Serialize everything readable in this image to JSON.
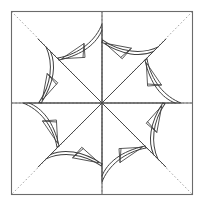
{
  "figure": {
    "title": "Eight-pointed curved star quilt block line drawing",
    "kind": "line-drawing",
    "canvas": {
      "width": 203,
      "height": 205,
      "background": "#ffffff"
    },
    "frame": {
      "name": "outer-square-border",
      "x": 11.5,
      "y": 11.5,
      "width": 181,
      "height": 183,
      "stroke": "#6b6b6b",
      "stroke_width": 1.1,
      "fill": "none"
    },
    "center": {
      "x": 102,
      "y": 103
    },
    "guides": {
      "stroke": "#9a9a9a",
      "stroke_width": 0.9,
      "dash": "1.6 2.2",
      "horizontal_midline": {
        "y": 103,
        "x1": 11.5,
        "x2": 192.5
      },
      "vertical_midline": {
        "x": 102,
        "y1": 11.5,
        "y2": 194.5
      },
      "diagonals": [
        {
          "name": "diagonal-tl-br",
          "x1": 11.5,
          "y1": 11.5,
          "x2": 192.5,
          "y2": 194.5
        },
        {
          "name": "diagonal-tr-bl",
          "x1": 192.5,
          "y1": 11.5,
          "x2": 11.5,
          "y2": 194.5
        }
      ]
    },
    "star": {
      "name": "central-eight-point-star",
      "stroke": "#4a4a4a",
      "stroke_width": 1.0,
      "fill": "none",
      "point_count": 8,
      "outer_radius": 78,
      "inner_radius": 34,
      "note": "four solid ray lines cross at the center forming eight radiating spokes"
    },
    "blades": {
      "name": "curved-crescent-blades",
      "count": 8,
      "stroke": "#3f3f3f",
      "stroke_width": 1.0,
      "fill": "none",
      "inner_stroke_width": 0.8,
      "description": "each blade is a crescent of two arcs with a small triangle and an internal perpendicular tick"
    },
    "colors": {
      "ink": "#3f3f3f",
      "frame": "#6b6b6b",
      "guide": "#9a9a9a",
      "paper": "#ffffff"
    }
  }
}
